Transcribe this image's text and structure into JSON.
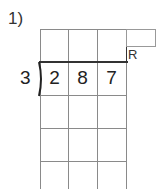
{
  "problem": {
    "number_label": "1)",
    "divisor": "3",
    "dividend_digits": [
      "2",
      "8",
      "7"
    ],
    "remainder_label": "R"
  },
  "grid": {
    "columns": 3,
    "rows": 5,
    "line_color": "#8a8a8a",
    "division_line_color": "#333333"
  }
}
